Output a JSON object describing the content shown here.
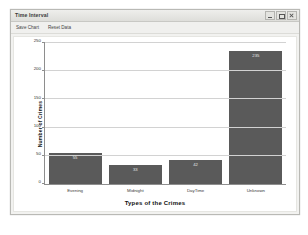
{
  "window": {
    "title": "Time Interval",
    "controls": [
      {
        "name": "minimize",
        "label": "–"
      },
      {
        "name": "maximize",
        "label": "□"
      },
      {
        "name": "close",
        "label": "×"
      }
    ]
  },
  "menubar": {
    "items": [
      {
        "label": "Save Chart"
      },
      {
        "label": "Reset Data"
      }
    ]
  },
  "chart_data": {
    "type": "bar",
    "title": "",
    "categories": [
      "Evening",
      "Midnight",
      "DayTime",
      "Unknown"
    ],
    "values": [
      55,
      33,
      42,
      235
    ],
    "xlabel": "Types of the Crimes",
    "ylabel": "Number of Crimes",
    "ylim": [
      0,
      250
    ],
    "yticks": [
      0,
      50,
      100,
      150,
      200,
      250
    ],
    "grid": true,
    "legend": "none",
    "bar_color": "#5a5a5a",
    "show_values": true
  }
}
